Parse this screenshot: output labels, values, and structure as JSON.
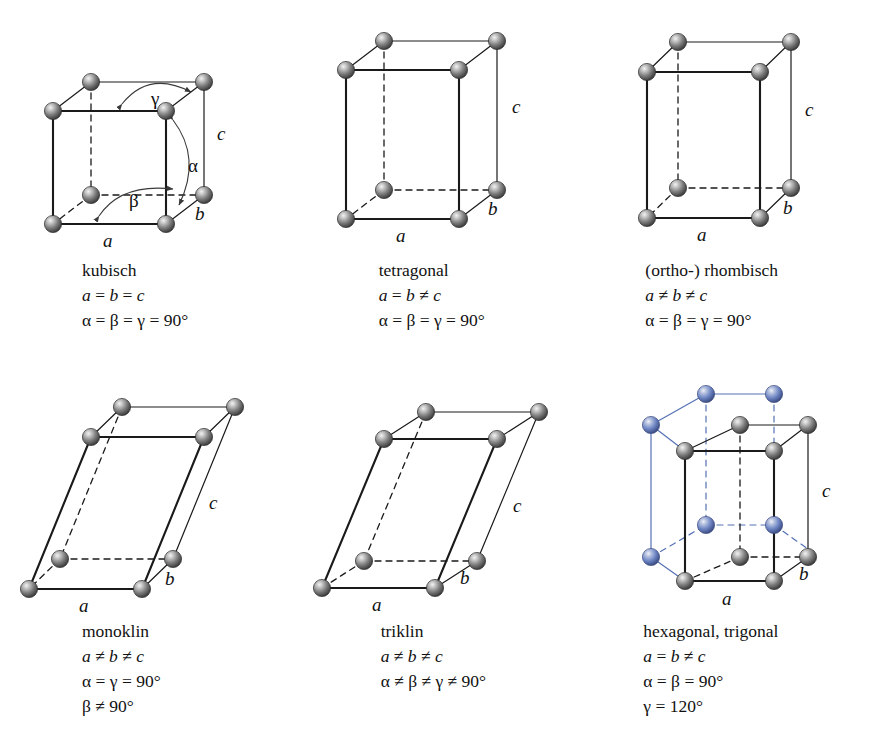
{
  "figure": {
    "title_present": false,
    "background": "#ffffff",
    "atom_color_primary": "#6e6e6e",
    "atom_color_secondary": "#6d85c4",
    "edge_color": "#1a1a1a",
    "edge_color_secondary": "#4a63a8"
  },
  "cells": [
    {
      "id": "kubisch",
      "name": "kubisch",
      "relations": [
        "a = b = c",
        "α = β = γ = 90°"
      ],
      "axis_labels": {
        "a": "a",
        "b": "b",
        "c": "c"
      },
      "angle_labels": {
        "alpha": "α",
        "beta": "β",
        "gamma": "γ"
      },
      "show_angles": true,
      "geometry": {
        "w": 113,
        "h": 113,
        "dx": 38,
        "dy": -29,
        "shear": 0
      },
      "secondary_atoms": false
    },
    {
      "id": "tetragonal",
      "name": "tetragonal",
      "relations": [
        "a = b ≠ c",
        "α = β = γ = 90°"
      ],
      "axis_labels": {
        "a": "a",
        "b": "b",
        "c": "c"
      },
      "angle_labels": {
        "alpha": "α",
        "beta": "β",
        "gamma": "γ"
      },
      "show_angles": false,
      "geometry": {
        "w": 113,
        "h": 158,
        "dx": 38,
        "dy": -29,
        "shear": 0
      },
      "secondary_atoms": false
    },
    {
      "id": "rhombisch",
      "name": "(ortho-) rhombisch",
      "relations": [
        "a ≠ b ≠ c",
        "α = β = γ = 90°"
      ],
      "axis_labels": {
        "a": "a",
        "b": "b",
        "c": "c"
      },
      "angle_labels": {
        "alpha": "α",
        "beta": "β",
        "gamma": "γ"
      },
      "show_angles": false,
      "geometry": {
        "w": 113,
        "h": 158,
        "dx": 31,
        "dy": -30,
        "shear": 0
      },
      "secondary_atoms": false
    },
    {
      "id": "monoklin",
      "name": "monoklin",
      "relations": [
        "a ≠ b ≠ c",
        "α = γ = 90°",
        "β ≠ 90°"
      ],
      "axis_labels": {
        "a": "a",
        "b": "b",
        "c": "c"
      },
      "angle_labels": {
        "alpha": "α",
        "beta": "β",
        "gamma": "γ"
      },
      "show_angles": false,
      "geometry": {
        "w": 113,
        "h": 152,
        "dx": 32,
        "dy": -30,
        "shear": 62
      },
      "secondary_atoms": false
    },
    {
      "id": "triklin",
      "name": "triklin",
      "relations": [
        "a ≠ b ≠ c",
        "α ≠ β ≠ γ ≠ 90°"
      ],
      "axis_labels": {
        "a": "a",
        "b": "b",
        "c": "c"
      },
      "angle_labels": {
        "alpha": "α",
        "beta": "β",
        "gamma": "γ"
      },
      "show_angles": false,
      "geometry": {
        "w": 113,
        "h": 152,
        "dx": 42,
        "dy": -27,
        "shear": 62
      },
      "secondary_atoms": false
    },
    {
      "id": "hexagonal",
      "name": "hexagonal, trigonal",
      "relations": [
        "a = b ≠ c",
        "α = β = 90°",
        "γ = 120°"
      ],
      "axis_labels": {
        "a": "a",
        "b": "b",
        "c": "c"
      },
      "angle_labels": {
        "alpha": "α",
        "beta": "β",
        "gamma": "γ"
      },
      "show_angles": false,
      "geometry": {
        "w": 80,
        "h": 152,
        "dx": 34,
        "dy": -30,
        "shear": 0
      },
      "secondary_atoms": true
    }
  ]
}
